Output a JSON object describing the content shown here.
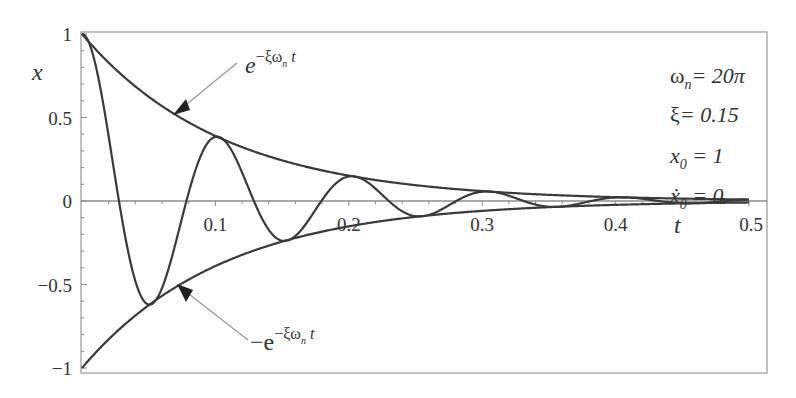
{
  "chart_data": {
    "type": "line",
    "title": "",
    "xlabel": "t",
    "ylabel": "x",
    "xlim": [
      0,
      0.5
    ],
    "ylim": [
      -1,
      1
    ],
    "grid": false,
    "x_ticks": [
      "0.1",
      "0.2",
      "0.3",
      "0.4",
      "0.5"
    ],
    "x_tick_values": [
      0.1,
      0.2,
      0.3,
      0.4,
      0.5
    ],
    "y_ticks": [
      "1",
      "0.5",
      "0",
      "−0.5",
      "−1"
    ],
    "y_tick_values": [
      1,
      0.5,
      0,
      -0.5,
      -1
    ],
    "parameters": {
      "omega_n": "20π",
      "omega_n_value": 62.8319,
      "xi": 0.15,
      "x0": 1,
      "xdot0": 0
    },
    "series": [
      {
        "name": "x(t) damped response",
        "formula": "e^(-ξωn t)(cos ωd t + ξ/√(1-ξ²) sin ωd t)",
        "x": [
          0,
          0.05,
          0.1,
          0.15,
          0.2,
          0.25,
          0.3,
          0.35,
          0.4,
          0.45,
          0.5
        ],
        "values": [
          1,
          -0.62,
          0.39,
          -0.24,
          0.15,
          -0.09,
          0.06,
          -0.04,
          0.02,
          -0.01,
          0.01
        ]
      },
      {
        "name": "upper envelope",
        "formula": "e^(-ξωn t)",
        "x": [
          0,
          0.1,
          0.2,
          0.3,
          0.4,
          0.5
        ],
        "values": [
          1,
          0.39,
          0.15,
          0.06,
          0.02,
          0.01
        ]
      },
      {
        "name": "lower envelope",
        "formula": "-e^(-ξωn t)",
        "x": [
          0,
          0.1,
          0.2,
          0.3,
          0.4,
          0.5
        ],
        "values": [
          -1,
          -0.39,
          -0.15,
          -0.06,
          -0.02,
          -0.01
        ]
      }
    ],
    "annotations": [
      {
        "text": "e^(-ξωn t)",
        "target": "upper envelope"
      },
      {
        "text": "-e^(-ξωn t)",
        "target": "lower envelope"
      }
    ]
  },
  "labels": {
    "y_axis": "x",
    "x_axis": "t",
    "upper_annot": {
      "base": "e",
      "exp": "−ξω",
      "sub": "n",
      "tail": " t"
    },
    "lower_annot": {
      "base": "−e",
      "exp": "−ξω",
      "sub": "n",
      "tail": " t"
    },
    "params": [
      {
        "lhs": "ω",
        "sub": "n",
        "rhs": "= 20π"
      },
      {
        "lhs": "ξ",
        "sub": "",
        "rhs": "= 0.15"
      },
      {
        "lhs": "x",
        "sub": "0",
        "rhs": " = 1"
      },
      {
        "lhs": "ẋ",
        "sub": "0",
        "rhs": " = 0"
      }
    ]
  },
  "colors": {
    "curve": "#3a3a3a",
    "axis": "#555555",
    "frame": "#888888",
    "arrow": "#888888"
  }
}
